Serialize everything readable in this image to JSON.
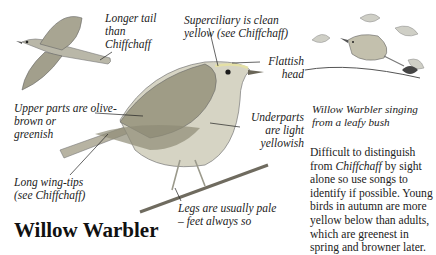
{
  "title": "Willow Warbler",
  "labels": {
    "tail": [
      "Longer tail",
      "than",
      "Chiffchaff"
    ],
    "superciliary": [
      "Superciliary is clean",
      "yellow (see Chiffchaff)"
    ],
    "head": [
      "Flattish",
      "head"
    ],
    "upperparts": [
      "Upper parts are olive-",
      "brown or",
      "greenish"
    ],
    "underparts": [
      "Underparts",
      "are light",
      "yellowish"
    ],
    "wingtips": [
      "Long wing-tips",
      "(see Chiffchaff)"
    ],
    "legs": [
      "Legs are usually pale",
      "– feet always so"
    ]
  },
  "caption": [
    "Willow Warbler singing",
    "from a leafy bush"
  ],
  "description": {
    "before": "Difficult to distinguish from ",
    "italic": "Chiffchaff",
    "after": " by sight alone so use songs to identify if possible. Young birds in autumn are more yellow below than adults, which are greenest in spring and browner later."
  },
  "illustrations": {
    "flying_bird": "willow-warbler-in-flight",
    "main_bird": "willow-warbler-perched",
    "singing_bird": "willow-warbler-singing-in-bush"
  }
}
